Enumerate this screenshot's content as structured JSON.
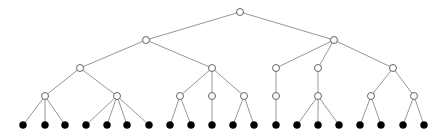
{
  "diagram": {
    "type": "tree",
    "style": {
      "edge_color": "#8a8a8a",
      "internal_fill": "#ffffff",
      "internal_stroke": "#555555",
      "leaf_fill": "#000000",
      "node_radius": 3.5
    },
    "nodes": [
      {
        "id": "r",
        "x": 240,
        "y": 12,
        "kind": "internal"
      },
      {
        "id": "a",
        "x": 146,
        "y": 40,
        "kind": "internal",
        "parent": "r"
      },
      {
        "id": "b",
        "x": 334,
        "y": 40,
        "kind": "internal",
        "parent": "r"
      },
      {
        "id": "a1",
        "x": 80,
        "y": 68,
        "kind": "internal",
        "parent": "a"
      },
      {
        "id": "a2",
        "x": 212,
        "y": 68,
        "kind": "internal",
        "parent": "a"
      },
      {
        "id": "b1",
        "x": 276,
        "y": 68,
        "kind": "internal",
        "parent": "b"
      },
      {
        "id": "b2",
        "x": 318,
        "y": 68,
        "kind": "internal",
        "parent": "b"
      },
      {
        "id": "b3",
        "x": 393,
        "y": 68,
        "kind": "internal",
        "parent": "b"
      },
      {
        "id": "a1a",
        "x": 45,
        "y": 96,
        "kind": "internal",
        "parent": "a1"
      },
      {
        "id": "a1b",
        "x": 117,
        "y": 96,
        "kind": "internal",
        "parent": "a1"
      },
      {
        "id": "a2a",
        "x": 180,
        "y": 96,
        "kind": "internal",
        "parent": "a2"
      },
      {
        "id": "a2b",
        "x": 212,
        "y": 96,
        "kind": "internal",
        "parent": "a2"
      },
      {
        "id": "a2c",
        "x": 244,
        "y": 96,
        "kind": "internal",
        "parent": "a2"
      },
      {
        "id": "b1a",
        "x": 276,
        "y": 96,
        "kind": "internal",
        "parent": "b1"
      },
      {
        "id": "b2a",
        "x": 318,
        "y": 96,
        "kind": "internal",
        "parent": "b2"
      },
      {
        "id": "b3a",
        "x": 371,
        "y": 96,
        "kind": "internal",
        "parent": "b3"
      },
      {
        "id": "b3b",
        "x": 414,
        "y": 96,
        "kind": "internal",
        "parent": "b3"
      },
      {
        "id": "l1",
        "x": 23,
        "y": 125,
        "kind": "leaf",
        "parent": "a1a"
      },
      {
        "id": "l2",
        "x": 45,
        "y": 125,
        "kind": "leaf",
        "parent": "a1a"
      },
      {
        "id": "l3",
        "x": 65,
        "y": 125,
        "kind": "leaf",
        "parent": "a1a"
      },
      {
        "id": "l4",
        "x": 86,
        "y": 125,
        "kind": "leaf",
        "parent": "a1b"
      },
      {
        "id": "l5",
        "x": 107,
        "y": 125,
        "kind": "leaf",
        "parent": "a1b"
      },
      {
        "id": "l6",
        "x": 127,
        "y": 125,
        "kind": "leaf",
        "parent": "a1b"
      },
      {
        "id": "l7",
        "x": 149,
        "y": 125,
        "kind": "leaf",
        "parent": "a1b"
      },
      {
        "id": "l8",
        "x": 170,
        "y": 125,
        "kind": "leaf",
        "parent": "a2a"
      },
      {
        "id": "l9",
        "x": 191,
        "y": 125,
        "kind": "leaf",
        "parent": "a2a"
      },
      {
        "id": "l10",
        "x": 212,
        "y": 125,
        "kind": "leaf",
        "parent": "a2b"
      },
      {
        "id": "l11",
        "x": 233,
        "y": 125,
        "kind": "leaf",
        "parent": "a2c"
      },
      {
        "id": "l12",
        "x": 254,
        "y": 125,
        "kind": "leaf",
        "parent": "a2c"
      },
      {
        "id": "l13",
        "x": 276,
        "y": 125,
        "kind": "leaf",
        "parent": "b1a"
      },
      {
        "id": "l14",
        "x": 297,
        "y": 125,
        "kind": "leaf",
        "parent": "b2a"
      },
      {
        "id": "l15",
        "x": 318,
        "y": 125,
        "kind": "leaf",
        "parent": "b2a"
      },
      {
        "id": "l16",
        "x": 339,
        "y": 125,
        "kind": "leaf",
        "parent": "b2a"
      },
      {
        "id": "l17",
        "x": 360,
        "y": 125,
        "kind": "leaf",
        "parent": "b3a"
      },
      {
        "id": "l18",
        "x": 381,
        "y": 125,
        "kind": "leaf",
        "parent": "b3a"
      },
      {
        "id": "l19",
        "x": 403,
        "y": 125,
        "kind": "leaf",
        "parent": "b3b"
      },
      {
        "id": "l20",
        "x": 424,
        "y": 125,
        "kind": "leaf",
        "parent": "b3b"
      }
    ]
  }
}
